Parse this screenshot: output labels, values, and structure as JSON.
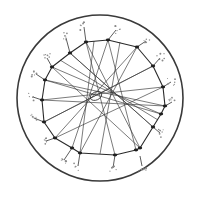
{
  "figure": {
    "colors": {
      "background": "#ffffff",
      "stroke": "#2a2a2a",
      "speckle": "#8a8a8a"
    },
    "outer_circle": {
      "cx": 100,
      "cy": 98,
      "r": 83
    },
    "ring_nodes": [
      [
        86,
        42
      ],
      [
        108,
        40
      ],
      [
        137,
        47
      ],
      [
        153,
        66
      ],
      [
        163,
        87
      ],
      [
        165,
        106
      ],
      [
        161,
        114
      ],
      [
        153,
        127
      ],
      [
        140,
        148
      ],
      [
        136,
        150
      ],
      [
        115,
        155
      ],
      [
        80,
        153
      ],
      [
        72,
        148
      ],
      [
        55,
        138
      ],
      [
        44,
        122
      ],
      [
        42,
        100
      ],
      [
        45,
        80
      ],
      [
        52,
        67
      ],
      [
        70,
        53
      ]
    ],
    "chords": [
      [
        86,
        42,
        115,
        155
      ],
      [
        108,
        40,
        72,
        148
      ],
      [
        108,
        40,
        136,
        150
      ],
      [
        137,
        47,
        55,
        138
      ],
      [
        153,
        66,
        44,
        122
      ],
      [
        163,
        87,
        42,
        100
      ],
      [
        165,
        106,
        45,
        80
      ],
      [
        161,
        114,
        52,
        67
      ],
      [
        153,
        127,
        70,
        53
      ],
      [
        140,
        148,
        86,
        42
      ],
      [
        80,
        153,
        137,
        47
      ],
      [
        55,
        138,
        163,
        87
      ],
      [
        44,
        122,
        153,
        66
      ],
      [
        42,
        100,
        165,
        106
      ],
      [
        45,
        80,
        161,
        114
      ],
      [
        52,
        67,
        140,
        148
      ],
      [
        70,
        53,
        153,
        127
      ],
      [
        94,
        41,
        80,
        153
      ],
      [
        120,
        42,
        100,
        154
      ],
      [
        60,
        60,
        158,
        120
      ]
    ],
    "sprouts": [
      [
        86,
        42,
        84,
        27
      ],
      [
        108,
        40,
        116,
        30
      ],
      [
        137,
        47,
        146,
        41
      ],
      [
        153,
        66,
        160,
        58
      ],
      [
        163,
        87,
        171,
        82
      ],
      [
        165,
        106,
        172,
        102
      ],
      [
        153,
        127,
        160,
        133
      ],
      [
        140,
        156,
        142,
        166
      ],
      [
        115,
        155,
        113,
        168
      ],
      [
        80,
        153,
        78,
        166
      ],
      [
        72,
        148,
        64,
        160
      ],
      [
        55,
        138,
        46,
        141
      ],
      [
        44,
        122,
        34,
        118
      ],
      [
        42,
        100,
        33,
        97
      ],
      [
        45,
        80,
        36,
        74
      ],
      [
        52,
        67,
        47,
        58
      ],
      [
        70,
        53,
        66,
        38
      ]
    ]
  }
}
